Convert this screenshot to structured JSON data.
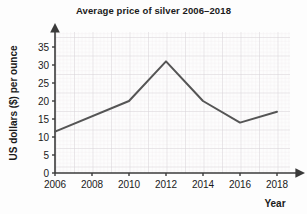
{
  "chart_data": {
    "type": "line",
    "title": "Average price of silver 2006–2018",
    "xlabel": "Year",
    "ylabel": "US dollars ($) per ounce",
    "x": [
      2006,
      2010,
      2012,
      2014,
      2016,
      2018
    ],
    "values": [
      11.5,
      20,
      31,
      20,
      14,
      17
    ],
    "categories": [
      "2006",
      "2010",
      "2012",
      "2014",
      "2016",
      "2018"
    ],
    "series": [
      {
        "name": "Average price of silver",
        "values": [
          11.5,
          20,
          31,
          20,
          14,
          17
        ]
      }
    ],
    "xlim": [
      2006,
      2019
    ],
    "ylim": [
      0,
      37
    ],
    "xticks": [
      2006,
      2008,
      2010,
      2012,
      2014,
      2016,
      2018
    ],
    "xtick_labels": [
      "2006",
      "2008",
      "2010",
      "2012",
      "2014",
      "2016",
      "2018"
    ],
    "yticks": [
      0,
      5,
      10,
      15,
      20,
      25,
      30,
      35
    ],
    "ytick_labels": [
      "0",
      "5",
      "10",
      "15",
      "20",
      "25",
      "30",
      "35"
    ],
    "grid": true,
    "legend": false,
    "line_color": "#555555",
    "grid_color": "#d9d4d8",
    "grid_minor_color": "#ece8eb",
    "axis_color": "#3a3a3a"
  }
}
